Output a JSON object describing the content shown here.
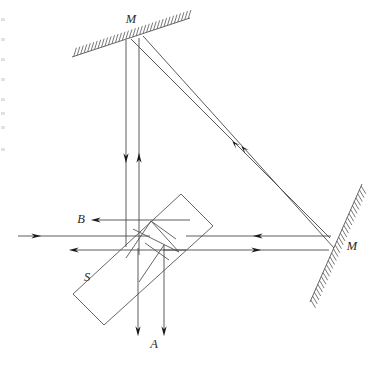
{
  "figure": {
    "type": "optics-ray-diagram",
    "width": 380,
    "height": 367,
    "background_color": "#ffffff",
    "line_color": "#4a4a4a",
    "arrow_color": "#1a1a1a"
  },
  "labels": [
    {
      "id": "mirror-top",
      "text": "M",
      "x": 131,
      "y": 23
    },
    {
      "id": "mirror-right",
      "text": "M",
      "x": 352,
      "y": 250
    },
    {
      "id": "output-b",
      "text": "B",
      "x": 81,
      "y": 223
    },
    {
      "id": "output-a",
      "text": "A",
      "x": 154,
      "y": 348
    },
    {
      "id": "beam-splitter",
      "text": "S",
      "x": 87,
      "y": 281
    }
  ],
  "components": {
    "top_mirror": {
      "name": "M",
      "x1": 72,
      "y1": 57,
      "x2": 190,
      "y2": 18,
      "hatch_count": 34,
      "hatch_length": 9,
      "hatch_side": "above"
    },
    "right_mirror": {
      "name": "M",
      "x1": 362,
      "y1": 184,
      "x2": 310,
      "y2": 302,
      "hatch_count": 30,
      "hatch_length": 9,
      "hatch_side": "right"
    },
    "beam_splitter": {
      "name": "S",
      "corners": [
        {
          "x": 181,
          "y": 194
        },
        {
          "x": 213,
          "y": 226
        },
        {
          "x": 104,
          "y": 325
        },
        {
          "x": 73,
          "y": 294
        }
      ],
      "internal_lines": [
        {
          "x1": 133,
          "y1": 229,
          "x2": 179,
          "y2": 252
        },
        {
          "x1": 179,
          "y1": 252,
          "x2": 151,
          "y2": 221
        },
        {
          "x1": 151,
          "y1": 221,
          "x2": 176,
          "y2": 239
        },
        {
          "x1": 145,
          "y1": 243,
          "x2": 169,
          "y2": 260
        },
        {
          "x1": 126,
          "y1": 258,
          "x2": 151,
          "y2": 221
        },
        {
          "x1": 139,
          "y1": 282,
          "x2": 164,
          "y2": 245
        }
      ]
    }
  },
  "rays": {
    "input": {
      "name": "incident-beam",
      "x1": 18,
      "y1": 236,
      "x2": 150,
      "y2": 236,
      "arrow": {
        "x": 36,
        "y": 236,
        "dir": "right"
      }
    },
    "output_b": {
      "name": "output-beam-b",
      "x1": 95,
      "y1": 220,
      "x2": 190,
      "y2": 220,
      "arrow": {
        "x": 96,
        "y": 220,
        "dir": "left"
      }
    },
    "output_left": {
      "name": "output-beam-left",
      "x1": 73,
      "y1": 250,
      "x2": 186,
      "y2": 250,
      "arrow": {
        "x": 74,
        "y": 250,
        "dir": "left"
      }
    },
    "vertical_down": {
      "name": "beam-to-top-mirror",
      "x1": 126,
      "y1": 40,
      "x2": 126,
      "y2": 247,
      "arrow": {
        "x": 126,
        "y": 158,
        "dir": "down"
      }
    },
    "vertical_up": {
      "name": "beam-from-top-mirror",
      "x1": 139,
      "y1": 38,
      "x2": 139,
      "y2": 255,
      "arrow": {
        "x": 139,
        "y": 158,
        "dir": "up"
      }
    },
    "horizontal_right_in": {
      "name": "beam-from-right-mirror",
      "x1": 186,
      "y1": 236,
      "x2": 331,
      "y2": 236,
      "arrow": {
        "x": 258,
        "y": 236,
        "dir": "left"
      }
    },
    "horizontal_right_out": {
      "name": "beam-to-right-mirror",
      "x1": 163,
      "y1": 250,
      "x2": 329,
      "y2": 250,
      "arrow": {
        "x": 256,
        "y": 250,
        "dir": "right"
      }
    },
    "diagonal_outer": {
      "name": "diagonal-beam-outer",
      "x1": 143,
      "y1": 36,
      "x2": 334,
      "y2": 248,
      "arrow": {
        "x": 245,
        "y": 150,
        "dir": "upleft"
      }
    },
    "diagonal_inner": {
      "name": "diagonal-beam-inner",
      "x1": 131,
      "y1": 39,
      "x2": 330,
      "y2": 238,
      "arrow": {
        "x": 236,
        "y": 145,
        "dir": "upleft"
      }
    },
    "down_a_left": {
      "name": "output-beam-a-left",
      "x1": 138,
      "y1": 248,
      "x2": 138,
      "y2": 331,
      "arrow": {
        "x": 138,
        "y": 331,
        "dir": "down"
      }
    },
    "down_a_right": {
      "name": "output-beam-a-right",
      "x1": 164,
      "y1": 245,
      "x2": 164,
      "y2": 331,
      "arrow": {
        "x": 164,
        "y": 331,
        "dir": "down"
      }
    }
  },
  "edge_artifacts": [
    {
      "y": 18
    },
    {
      "y": 38
    },
    {
      "y": 58
    },
    {
      "y": 78
    },
    {
      "y": 98
    },
    {
      "y": 112
    },
    {
      "y": 126
    },
    {
      "y": 148
    }
  ]
}
